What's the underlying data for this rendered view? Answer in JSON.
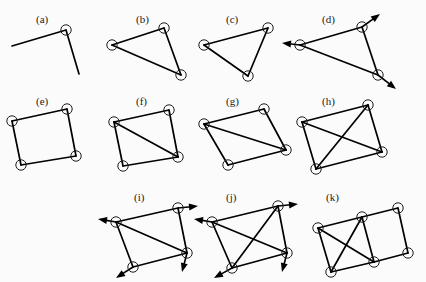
{
  "figure": {
    "background_color": "#fbfbfb",
    "line_color": "#000000",
    "joint_fill": "#ffffff",
    "joint_stroke": "#1d1d1d"
  },
  "panels": [
    {
      "id": "a",
      "label": "(a)",
      "label_pos": [
        36,
        14
      ],
      "origin": [
        4,
        18
      ],
      "joints": [
        [
          62,
          12
        ]
      ],
      "bars": [
        [
          [
            8,
            28
          ],
          [
            62,
            12
          ]
        ],
        [
          [
            62,
            12
          ],
          [
            75,
            56
          ]
        ]
      ],
      "arrows": []
    },
    {
      "id": "b",
      "label": "(b)",
      "label_pos": [
        136,
        14
      ],
      "origin": [
        104,
        18
      ],
      "joints": [
        [
          8,
          27
        ],
        [
          60,
          10
        ],
        [
          77,
          57
        ]
      ],
      "bars": [
        [
          [
            8,
            27
          ],
          [
            60,
            10
          ]
        ],
        [
          [
            60,
            10
          ],
          [
            77,
            57
          ]
        ],
        [
          [
            77,
            57
          ],
          [
            8,
            27
          ]
        ]
      ],
      "arrows": []
    },
    {
      "id": "c",
      "label": "(c)",
      "label_pos": [
        226,
        14
      ],
      "origin": [
        196,
        18
      ],
      "joints": [
        [
          8,
          27
        ],
        [
          72,
          10
        ],
        [
          52,
          58
        ]
      ],
      "bars": [
        [
          [
            8,
            27
          ],
          [
            72,
            10
          ]
        ],
        [
          [
            72,
            10
          ],
          [
            52,
            58
          ]
        ],
        [
          [
            52,
            58
          ],
          [
            8,
            27
          ]
        ]
      ],
      "arrows": []
    },
    {
      "id": "d",
      "label": "(d)",
      "label_pos": [
        322,
        14
      ],
      "origin": [
        288,
        18
      ],
      "joints": [
        [
          12,
          27
        ],
        [
          74,
          9
        ],
        [
          90,
          57
        ]
      ],
      "bars": [
        [
          [
            12,
            27
          ],
          [
            74,
            9
          ]
        ],
        [
          [
            74,
            9
          ],
          [
            90,
            57
          ]
        ],
        [
          [
            90,
            57
          ],
          [
            12,
            27
          ]
        ]
      ],
      "arrows": [
        {
          "from": [
            12,
            27
          ],
          "to": [
            -6,
            25
          ],
          "label": "left-arrow"
        },
        {
          "from": [
            74,
            9
          ],
          "to": [
            92,
            -4
          ],
          "label": "up-right-arrow"
        },
        {
          "from": [
            90,
            57
          ],
          "to": [
            108,
            71
          ],
          "label": "down-right-arrow"
        }
      ]
    },
    {
      "id": "e",
      "label": "(e)",
      "label_pos": [
        36,
        96
      ],
      "origin": [
        4,
        100
      ],
      "joints": [
        [
          8,
          21
        ],
        [
          63,
          9
        ],
        [
          72,
          56
        ],
        [
          17,
          65
        ]
      ],
      "bars": [
        [
          [
            8,
            21
          ],
          [
            63,
            9
          ]
        ],
        [
          [
            63,
            9
          ],
          [
            72,
            56
          ]
        ],
        [
          [
            72,
            56
          ],
          [
            17,
            65
          ]
        ],
        [
          [
            17,
            65
          ],
          [
            8,
            21
          ]
        ]
      ],
      "arrows": []
    },
    {
      "id": "f",
      "label": "(f)",
      "label_pos": [
        136,
        96
      ],
      "origin": [
        104,
        100
      ],
      "joints": [
        [
          10,
          22
        ],
        [
          65,
          10
        ],
        [
          74,
          57
        ],
        [
          19,
          66
        ]
      ],
      "bars": [
        [
          [
            10,
            22
          ],
          [
            65,
            10
          ]
        ],
        [
          [
            65,
            10
          ],
          [
            74,
            57
          ]
        ],
        [
          [
            74,
            57
          ],
          [
            19,
            66
          ]
        ],
        [
          [
            19,
            66
          ],
          [
            10,
            22
          ]
        ],
        [
          [
            10,
            22
          ],
          [
            74,
            57
          ]
        ]
      ],
      "arrows": []
    },
    {
      "id": "g",
      "label": "(g)",
      "label_pos": [
        226,
        96
      ],
      "origin": [
        196,
        100
      ],
      "joints": [
        [
          8,
          24
        ],
        [
          68,
          9
        ],
        [
          90,
          50
        ],
        [
          32,
          65
        ]
      ],
      "bars": [
        [
          [
            8,
            24
          ],
          [
            68,
            9
          ]
        ],
        [
          [
            68,
            9
          ],
          [
            90,
            50
          ]
        ],
        [
          [
            90,
            50
          ],
          [
            32,
            65
          ]
        ],
        [
          [
            32,
            65
          ],
          [
            8,
            24
          ]
        ],
        [
          [
            8,
            24
          ],
          [
            90,
            50
          ]
        ]
      ],
      "arrows": []
    },
    {
      "id": "h",
      "label": "(h)",
      "label_pos": [
        322,
        96
      ],
      "origin": [
        288,
        100
      ],
      "joints": [
        [
          14,
          22
        ],
        [
          80,
          5
        ],
        [
          94,
          52
        ],
        [
          28,
          69
        ]
      ],
      "bars": [
        [
          [
            14,
            22
          ],
          [
            80,
            5
          ]
        ],
        [
          [
            80,
            5
          ],
          [
            94,
            52
          ]
        ],
        [
          [
            94,
            52
          ],
          [
            28,
            69
          ]
        ],
        [
          [
            28,
            69
          ],
          [
            14,
            22
          ]
        ],
        [
          [
            14,
            22
          ],
          [
            94,
            52
          ]
        ],
        [
          [
            80,
            5
          ],
          [
            28,
            69
          ]
        ]
      ],
      "arrows": []
    },
    {
      "id": "i",
      "label": "(i)",
      "label_pos": [
        134,
        192
      ],
      "origin": [
        98,
        196
      ],
      "joints": [
        [
          18,
          26
        ],
        [
          80,
          12
        ],
        [
          89,
          57
        ],
        [
          35,
          71
        ]
      ],
      "bars": [
        [
          [
            18,
            26
          ],
          [
            80,
            12
          ]
        ],
        [
          [
            80,
            12
          ],
          [
            89,
            57
          ]
        ],
        [
          [
            89,
            57
          ],
          [
            35,
            71
          ]
        ],
        [
          [
            35,
            71
          ],
          [
            18,
            26
          ]
        ],
        [
          [
            18,
            26
          ],
          [
            89,
            57
          ]
        ]
      ],
      "arrows": [
        {
          "from": [
            18,
            26
          ],
          "to": [
            0,
            23
          ],
          "label": "left-arrow"
        },
        {
          "from": [
            80,
            12
          ],
          "to": [
            100,
            10
          ],
          "label": "right-arrow"
        },
        {
          "from": [
            89,
            57
          ],
          "to": [
            84,
            76
          ],
          "label": "down-left-arrow"
        },
        {
          "from": [
            35,
            71
          ],
          "to": [
            18,
            82
          ],
          "label": "down-left-arrow"
        }
      ]
    },
    {
      "id": "j",
      "label": "(j)",
      "label_pos": [
        226,
        192
      ],
      "origin": [
        194,
        196
      ],
      "joints": [
        [
          18,
          26
        ],
        [
          84,
          10
        ],
        [
          93,
          57
        ],
        [
          38,
          72
        ]
      ],
      "bars": [
        [
          [
            18,
            26
          ],
          [
            84,
            10
          ]
        ],
        [
          [
            84,
            10
          ],
          [
            93,
            57
          ]
        ],
        [
          [
            93,
            57
          ],
          [
            38,
            72
          ]
        ],
        [
          [
            38,
            72
          ],
          [
            18,
            26
          ]
        ],
        [
          [
            18,
            26
          ],
          [
            93,
            57
          ]
        ],
        [
          [
            84,
            10
          ],
          [
            38,
            72
          ]
        ]
      ],
      "arrows": [
        {
          "from": [
            18,
            26
          ],
          "to": [
            0,
            23
          ],
          "label": "left-arrow"
        },
        {
          "from": [
            84,
            10
          ],
          "to": [
            104,
            8
          ],
          "label": "right-arrow"
        },
        {
          "from": [
            93,
            57
          ],
          "to": [
            88,
            76
          ],
          "label": "down-arrow"
        },
        {
          "from": [
            38,
            72
          ],
          "to": [
            20,
            82
          ],
          "label": "down-left-arrow"
        }
      ]
    },
    {
      "id": "k",
      "label": "(k)",
      "label_pos": [
        326,
        192
      ],
      "origin": [
        300,
        196
      ],
      "joints": [
        [
          18,
          32
        ],
        [
          62,
          21
        ],
        [
          98,
          12
        ],
        [
          31,
          76
        ],
        [
          74,
          66
        ],
        [
          108,
          57
        ]
      ],
      "bars": [
        [
          [
            18,
            32
          ],
          [
            62,
            21
          ]
        ],
        [
          [
            62,
            21
          ],
          [
            98,
            12
          ]
        ],
        [
          [
            98,
            12
          ],
          [
            108,
            57
          ]
        ],
        [
          [
            108,
            57
          ],
          [
            74,
            66
          ]
        ],
        [
          [
            74,
            66
          ],
          [
            31,
            76
          ]
        ],
        [
          [
            31,
            76
          ],
          [
            18,
            32
          ]
        ],
        [
          [
            62,
            21
          ],
          [
            74,
            66
          ]
        ],
        [
          [
            18,
            32
          ],
          [
            74,
            66
          ]
        ],
        [
          [
            62,
            21
          ],
          [
            31,
            76
          ]
        ]
      ],
      "arrows": []
    }
  ]
}
